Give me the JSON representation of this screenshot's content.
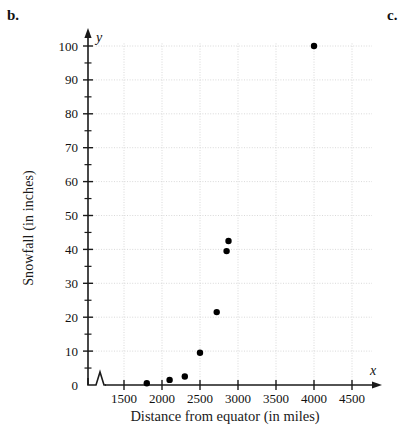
{
  "figure": {
    "part_label_b": "b.",
    "part_label_c": "c."
  },
  "axes": {
    "x_variable_symbol": "x",
    "y_variable_symbol": "y",
    "x_title": "Distance from equator (in miles)",
    "y_title": "Snowfall (in inches)",
    "x_tick_labels": [
      "1500",
      "2000",
      "2500",
      "3000",
      "3500",
      "4000",
      "4500"
    ],
    "y_tick_labels": [
      "0",
      "10",
      "20",
      "30",
      "40",
      "50",
      "60",
      "70",
      "80",
      "90",
      "100"
    ],
    "axis_break": "zigzag-break"
  },
  "chart_data": {
    "type": "scatter",
    "title": "",
    "subtitle": "",
    "xlabel": "Distance from equator (in miles)",
    "ylabel": "Snowfall (in inches)",
    "xlim": [
      1250,
      4700
    ],
    "ylim": [
      0,
      104
    ],
    "x_ticks": [
      1500,
      2000,
      2500,
      3000,
      3500,
      4000,
      4500
    ],
    "y_ticks": [
      0,
      10,
      20,
      30,
      40,
      50,
      60,
      70,
      80,
      90,
      100
    ],
    "grid": true,
    "grid_style": "dotted",
    "legend": "none",
    "axis_break_x": true,
    "marker": "filled-circle",
    "marker_color": "#000000",
    "series": [
      {
        "name": "Snowfall vs distance from equator",
        "points": [
          {
            "x": 1800,
            "y": 0.5
          },
          {
            "x": 2100,
            "y": 1.5
          },
          {
            "x": 2300,
            "y": 2.5
          },
          {
            "x": 2500,
            "y": 9.5
          },
          {
            "x": 2720,
            "y": 21.5
          },
          {
            "x": 2850,
            "y": 39.5
          },
          {
            "x": 2875,
            "y": 42.5
          },
          {
            "x": 4000,
            "y": 100
          }
        ]
      }
    ]
  }
}
